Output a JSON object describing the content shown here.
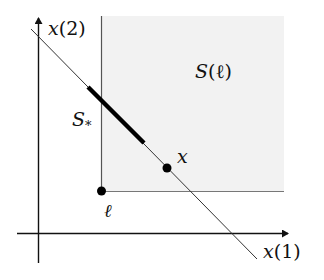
{
  "diagram": {
    "axes": {
      "x_label_var": "x",
      "x_label_idx": "(1)",
      "y_label_var": "x",
      "y_label_idx": "(2)"
    },
    "region_label_S": "S",
    "region_label_arg": "(ℓ)",
    "segment_label_S": "S",
    "segment_label_sub": "*",
    "point_x_label": "x",
    "point_l_label": "ℓ",
    "colors": {
      "region_fill": "#f2f2f2",
      "line": "#111111",
      "region_border": "#666666"
    }
  }
}
